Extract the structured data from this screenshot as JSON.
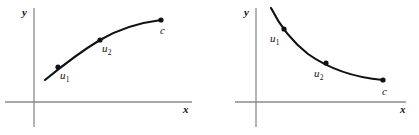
{
  "figure": {
    "width": 419,
    "height": 135,
    "background": "#ffffff",
    "curve_color": "#111111",
    "axis_color": "#8a8a8a"
  },
  "panels": [
    {
      "id": "left",
      "description": "increasing concave-down curve",
      "axes": {
        "y_label": "y",
        "x_label": "x",
        "origin": {
          "x": 34,
          "y": 102
        },
        "x_axis": {
          "x1": 5,
          "x2": 192,
          "y": 102
        },
        "y_axis": {
          "x": 34,
          "y1": 8,
          "y2": 127
        }
      },
      "curve": {
        "path": "M 45 80 C 62 66, 80 52, 100 40 C 122 27, 145 22, 161 20",
        "points": [
          {
            "label": "u",
            "sub": "1",
            "x": 58,
            "y": 67,
            "label_x": 60,
            "label_y": 70
          },
          {
            "label": "u",
            "sub": "2",
            "x": 100,
            "y": 40,
            "label_x": 102,
            "label_y": 43
          },
          {
            "label": "c",
            "sub": "",
            "x": 161,
            "y": 20,
            "label_x": 160,
            "label_y": 25
          }
        ]
      }
    },
    {
      "id": "right",
      "description": "decreasing convex (concave-up) curve",
      "axes": {
        "y_label": "y",
        "x_label": "x",
        "origin": {
          "x": 46,
          "y": 102
        },
        "x_axis": {
          "x1": 25,
          "x2": 196,
          "y": 102
        },
        "y_axis": {
          "x": 46,
          "y1": 8,
          "y2": 127
        },
        "offset_x": 210
      },
      "curve": {
        "path": "M 61 8 C 68 22, 80 40, 98 54 C 122 71, 150 78, 173 80",
        "points": [
          {
            "label": "u",
            "sub": "1",
            "x": 74,
            "y": 29,
            "label_x": 62,
            "label_y": 33
          },
          {
            "label": "u",
            "sub": "2",
            "x": 116,
            "y": 63,
            "label_x": 106,
            "label_y": 67
          },
          {
            "label": "c",
            "sub": "",
            "x": 173,
            "y": 80,
            "label_x": 172,
            "label_y": 86
          }
        ]
      }
    }
  ],
  "labels": {
    "y_axis": "y",
    "x_axis": "x",
    "u1": "u",
    "u1_sub": "1",
    "u2": "u",
    "u2_sub": "2",
    "c": "c"
  }
}
